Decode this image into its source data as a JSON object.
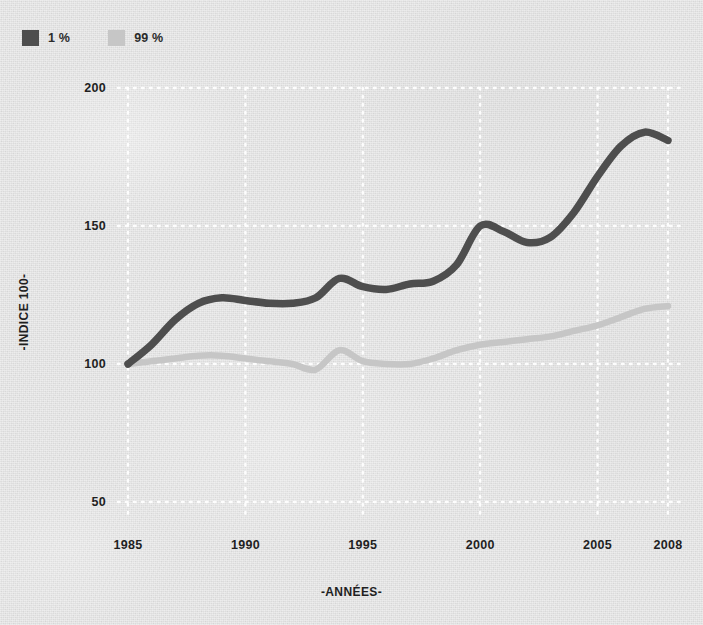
{
  "chart_data": {
    "type": "line",
    "title": "",
    "xlabel": "-ANNÉES-",
    "ylabel": "-INDICE 100-",
    "xlim": [
      1985,
      2008
    ],
    "ylim": [
      50,
      200
    ],
    "yticks": [
      "50",
      "100",
      "150",
      "200"
    ],
    "ytick_values": [
      50,
      100,
      150,
      200
    ],
    "xticks": [
      "1985",
      "1990",
      "1995",
      "2000",
      "2005",
      "2008"
    ],
    "xtick_values": [
      1985,
      1990,
      1995,
      2000,
      2005,
      2008
    ],
    "grid": "dotted-white",
    "legend_position": "top-left",
    "x": [
      1985,
      1986,
      1987,
      1988,
      1989,
      1990,
      1991,
      1992,
      1993,
      1994,
      1995,
      1996,
      1997,
      1998,
      1999,
      2000,
      2001,
      2002,
      2003,
      2004,
      2005,
      2006,
      2007,
      2008
    ],
    "series": [
      {
        "name": "1 %",
        "color": "#4e4e4e",
        "values": [
          100,
          107,
          116,
          122,
          124,
          123,
          122,
          122,
          124,
          131,
          128,
          127,
          129,
          130,
          136,
          150,
          148,
          144,
          146,
          155,
          168,
          179,
          184,
          181
        ]
      },
      {
        "name": "99 %",
        "color": "#c6c6c6",
        "values": [
          100,
          101,
          102,
          103,
          103,
          102,
          101,
          100,
          98,
          105,
          101,
          100,
          100,
          102,
          105,
          107,
          108,
          109,
          110,
          112,
          114,
          117,
          120,
          121
        ]
      }
    ]
  },
  "legend": {
    "items": [
      {
        "label": "1 %",
        "color": "#4e4e4e"
      },
      {
        "label": "99 %",
        "color": "#c6c6c6"
      }
    ]
  },
  "axes": {
    "y_title": "-INDICE 100-",
    "x_title": "-ANNÉES-"
  }
}
